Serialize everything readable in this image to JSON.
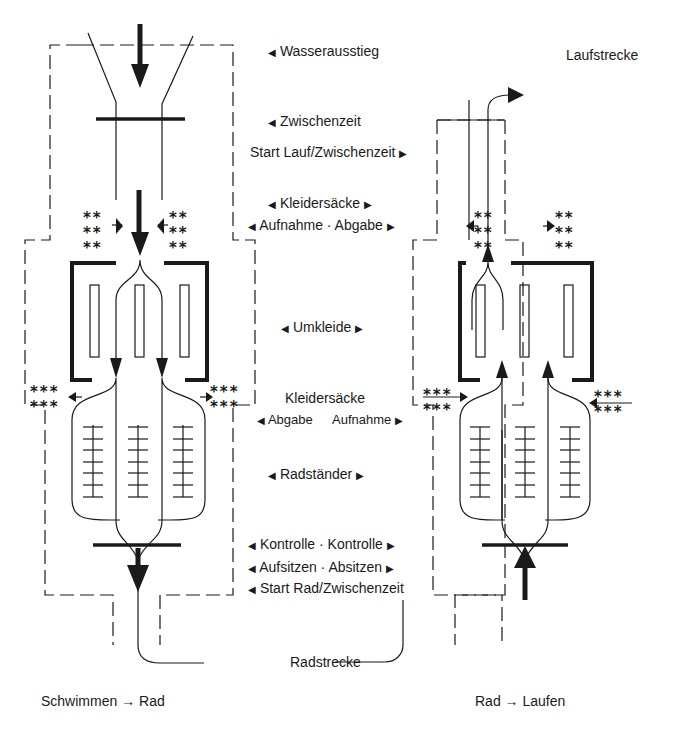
{
  "labels": {
    "wasserausstieg": "Wasserausstieg",
    "zwischenzeit": "Zwischenzeit",
    "start_lauf": "Start Lauf/Zwischenzeit",
    "kleidersaecke_top": "Kleidersäcke",
    "aufnahme_abgabe": "Aufnahme · Abgabe",
    "umkleide": "Umkleide",
    "kleidersaecke_mid": "Kleidersäcke",
    "abgabe": "Abgabe",
    "aufnahme": "Aufnahme",
    "radstaender": "Radständer",
    "kontrolle": "Kontrolle · Kontrolle",
    "aufsitzen": "Aufsitzen · Absitzen",
    "start_rad": "Start Rad/Zwischenzeit",
    "radstrecke": "Radstrecke",
    "laufstrecke": "Laufstrecke",
    "caption_left": "Schwimmen → Rad",
    "caption_right": "Rad → Laufen"
  },
  "markers": {
    "left": "◀",
    "right": "▶",
    "bags_2": "**\n**\n**",
    "bags_3": "***\n***"
  },
  "colors": {
    "ink": "#1a1a1a",
    "background": "#ffffff"
  }
}
